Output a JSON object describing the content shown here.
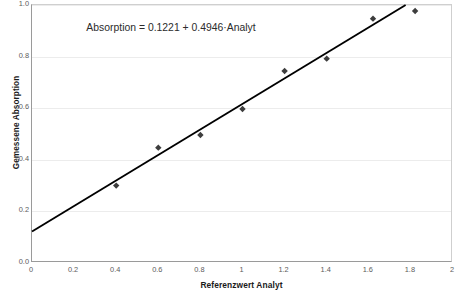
{
  "chart_data": {
    "type": "scatter",
    "title": "",
    "xlabel": "Referenzwert Analyt",
    "ylabel": "Gemessene Absorption",
    "xlim": [
      0,
      2
    ],
    "ylim": [
      0,
      1.0
    ],
    "grid": "horizontal",
    "legend": "none",
    "xticks": [
      "0",
      "0.2",
      "0.4",
      "0.6",
      "0.8",
      "1",
      "1.2",
      "1.4",
      "1.6",
      "1.8",
      "2"
    ],
    "xtick_values": [
      0,
      0.2,
      0.4,
      0.6,
      0.8,
      1,
      1.2,
      1.4,
      1.6,
      1.8,
      2
    ],
    "yticks": [
      "0.0",
      "0.2",
      "0.4",
      "0.6",
      "0.8",
      "1.0"
    ],
    "ytick_values": [
      0,
      0.2,
      0.4,
      0.6,
      0.8,
      1.0
    ],
    "series": [
      {
        "name": "Messpunkte",
        "type": "scatter",
        "marker": "diamond",
        "color": "#3d3d3d",
        "x": [
          0.4,
          0.6,
          0.8,
          1.0,
          1.2,
          1.4,
          1.62,
          1.82
        ],
        "y": [
          0.3,
          0.447,
          0.496,
          0.597,
          0.744,
          0.792,
          0.947,
          0.977
        ]
      },
      {
        "name": "Regressionsgerade",
        "type": "line",
        "color": "#000000",
        "intercept": 0.1221,
        "slope": 0.4946,
        "x": [
          0,
          1.775
        ],
        "y": [
          0.1221,
          1.0
        ]
      }
    ],
    "annotations": [
      {
        "name": "regression-equation",
        "text": "Absorption = 0.1221 + 0.4946·Analyt",
        "x": 0.62,
        "y": 0.915
      }
    ]
  },
  "colors": {
    "marker": "#3d3d3d",
    "line": "#000000",
    "grid": "#ececec",
    "axis": "#9a9a9a",
    "text": "#1a1a1a",
    "tick_text": "#5c5c5c"
  }
}
